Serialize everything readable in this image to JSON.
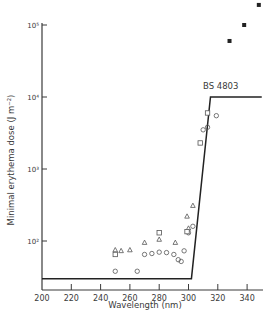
{
  "chart_data": {
    "type": "scatter",
    "title": "",
    "xlabel": "Wavelength (nm)",
    "ylabel": "Minimal erythema dose (J m⁻²)",
    "yscale": "log",
    "xlim": [
      200,
      350
    ],
    "ylim": [
      20,
      100000
    ],
    "x_ticks": [
      200,
      220,
      240,
      260,
      280,
      300,
      320,
      340
    ],
    "y_ticks": [
      {
        "value": 100000,
        "label": "10⁵"
      },
      {
        "value": 10000,
        "label": "10⁴"
      },
      {
        "value": 1000,
        "label": "10³"
      },
      {
        "value": 100,
        "label": "10²"
      }
    ],
    "grid": false,
    "annotations": [
      {
        "text": "BS 4803",
        "x": 322,
        "y": 13000
      }
    ],
    "series": [
      {
        "name": "BS 4803",
        "kind": "line",
        "points": [
          [
            200,
            30
          ],
          [
            302,
            30
          ],
          [
            315,
            10000
          ],
          [
            350,
            10000
          ]
        ]
      },
      {
        "name": "open circles",
        "kind": "marker",
        "marker": "circle",
        "points": [
          [
            250,
            38
          ],
          [
            265,
            38
          ],
          [
            270,
            65
          ],
          [
            275,
            67
          ],
          [
            280,
            70
          ],
          [
            285,
            69
          ],
          [
            290,
            65
          ],
          [
            293,
            55
          ],
          [
            295,
            52
          ],
          [
            297,
            73
          ],
          [
            300,
            130
          ],
          [
            303,
            160
          ],
          [
            310,
            3500
          ],
          [
            313,
            3800
          ],
          [
            319,
            5500
          ]
        ]
      },
      {
        "name": "open triangles",
        "kind": "marker",
        "marker": "triangle",
        "points": [
          [
            250,
            75
          ],
          [
            254,
            73
          ],
          [
            260,
            75
          ],
          [
            270,
            95
          ],
          [
            280,
            105
          ],
          [
            291,
            95
          ],
          [
            300,
            150
          ],
          [
            299,
            220
          ],
          [
            303,
            310
          ]
        ]
      },
      {
        "name": "open squares",
        "kind": "marker",
        "marker": "square",
        "points": [
          [
            250,
            65
          ],
          [
            280,
            130
          ],
          [
            299,
            135
          ],
          [
            308,
            2300
          ],
          [
            313,
            6000
          ]
        ]
      },
      {
        "name": "filled squares",
        "kind": "marker",
        "marker": "filled-square",
        "points": [
          [
            328,
            60000
          ],
          [
            338,
            100000
          ],
          [
            348,
            190000
          ]
        ]
      }
    ]
  }
}
